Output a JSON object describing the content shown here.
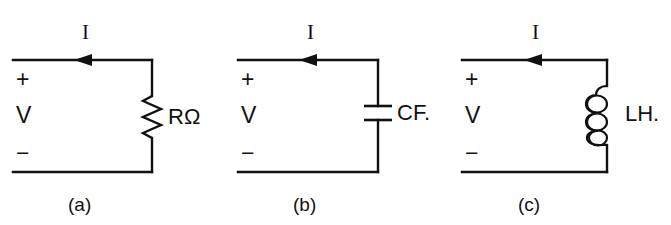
{
  "figure": {
    "background_color": "#ffffff",
    "ink_color": "#111111"
  },
  "circuits": [
    {
      "id": "a",
      "caption": "(a)",
      "current_label": "I",
      "source_label": "V",
      "plus_sign": "+",
      "minus_sign": "−",
      "component": {
        "type": "resistor",
        "icon": "resistor-zigzag-icon",
        "label": "RΩ"
      }
    },
    {
      "id": "b",
      "caption": "(b)",
      "current_label": "I",
      "source_label": "V",
      "plus_sign": "+",
      "minus_sign": "−",
      "component": {
        "type": "capacitor",
        "icon": "capacitor-plates-icon",
        "label": "CF."
      }
    },
    {
      "id": "c",
      "caption": "(c)",
      "current_label": "I",
      "source_label": "V",
      "plus_sign": "+",
      "minus_sign": "−",
      "component": {
        "type": "inductor",
        "icon": "inductor-coil-icon",
        "label": "LH."
      }
    }
  ]
}
